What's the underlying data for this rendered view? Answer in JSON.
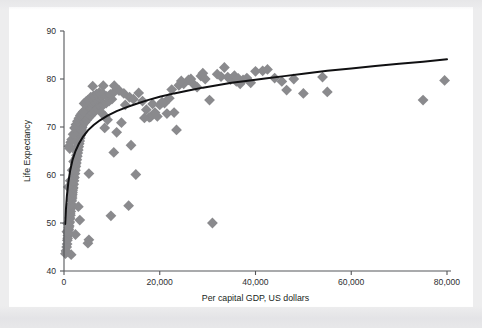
{
  "page": {
    "background_color": "#ededee",
    "sheet_color": "#ffffff"
  },
  "chart_data": {
    "type": "scatter",
    "title": "",
    "xlabel": "Per capital GDP, US dollars",
    "ylabel": "Life Expectancy",
    "xlim": [
      0,
      80000
    ],
    "ylim": [
      40,
      90
    ],
    "xticks": [
      0,
      20000,
      40000,
      60000,
      80000
    ],
    "xticklabels": [
      "0",
      "20,000",
      "40,000",
      "60,000",
      "80,000"
    ],
    "yticks": [
      40,
      50,
      60,
      70,
      80,
      90
    ],
    "yticklabels": [
      "40",
      "50",
      "60",
      "70",
      "80",
      "90"
    ],
    "grid": false,
    "legend": null,
    "marker": {
      "shape": "diamond",
      "color": "#8a8a8d",
      "size": 5.4
    },
    "series": [
      {
        "name": "Countries",
        "points": [
          [
            300,
            43.6
          ],
          [
            420,
            44.2
          ],
          [
            560,
            45.0
          ],
          [
            700,
            46.4
          ],
          [
            820,
            47.4
          ],
          [
            900,
            48.0
          ],
          [
            1000,
            48.6
          ],
          [
            1100,
            49.4
          ],
          [
            1200,
            50.2
          ],
          [
            1250,
            50.9
          ],
          [
            1350,
            51.6
          ],
          [
            1400,
            52.4
          ],
          [
            1500,
            53.1
          ],
          [
            1560,
            53.9
          ],
          [
            1600,
            54.6
          ],
          [
            1700,
            55.2
          ],
          [
            1750,
            56.0
          ],
          [
            1800,
            56.8
          ],
          [
            1900,
            57.4
          ],
          [
            1950,
            58.1
          ],
          [
            2000,
            58.8
          ],
          [
            2100,
            59.5
          ],
          [
            2150,
            60.2
          ],
          [
            2200,
            60.9
          ],
          [
            2300,
            61.5
          ],
          [
            2350,
            62.2
          ],
          [
            2400,
            62.9
          ],
          [
            2500,
            63.5
          ],
          [
            2600,
            64.1
          ],
          [
            2700,
            64.8
          ],
          [
            2800,
            65.4
          ],
          [
            2900,
            66.0
          ],
          [
            3000,
            66.5
          ],
          [
            3100,
            67.0
          ],
          [
            3200,
            67.6
          ],
          [
            3300,
            68.1
          ],
          [
            3400,
            68.6
          ],
          [
            3500,
            69.1
          ],
          [
            3600,
            69.6
          ],
          [
            3700,
            70.1
          ],
          [
            3800,
            70.5
          ],
          [
            3900,
            70.9
          ],
          [
            4000,
            71.3
          ],
          [
            4100,
            71.7
          ],
          [
            4200,
            72.0
          ],
          [
            4300,
            72.3
          ],
          [
            4400,
            72.6
          ],
          [
            4500,
            72.9
          ],
          [
            4600,
            73.2
          ],
          [
            4700,
            73.5
          ],
          [
            4800,
            73.8
          ],
          [
            5000,
            74.0
          ],
          [
            5200,
            74.3
          ],
          [
            5400,
            74.5
          ],
          [
            5600,
            74.8
          ],
          [
            5800,
            75.0
          ],
          [
            6000,
            75.2
          ],
          [
            6200,
            75.4
          ],
          [
            6400,
            75.6
          ],
          [
            6600,
            75.7
          ],
          [
            6800,
            75.9
          ],
          [
            7000,
            76.1
          ],
          [
            500,
            44.0
          ],
          [
            650,
            45.6
          ],
          [
            760,
            46.8
          ],
          [
            880,
            47.9
          ],
          [
            980,
            49.0
          ],
          [
            1080,
            50.0
          ],
          [
            1180,
            51.1
          ],
          [
            1280,
            52.0
          ],
          [
            1380,
            53.0
          ],
          [
            1480,
            53.8
          ],
          [
            1580,
            54.8
          ],
          [
            1680,
            55.6
          ],
          [
            1780,
            56.4
          ],
          [
            1880,
            57.2
          ],
          [
            1980,
            58.0
          ],
          [
            2080,
            58.8
          ],
          [
            2180,
            59.5
          ],
          [
            2280,
            60.3
          ],
          [
            2380,
            61.0
          ],
          [
            2480,
            61.8
          ],
          [
            2580,
            62.5
          ],
          [
            2680,
            63.2
          ],
          [
            2780,
            63.9
          ],
          [
            2880,
            64.6
          ],
          [
            2980,
            65.2
          ],
          [
            3080,
            65.9
          ],
          [
            3180,
            66.5
          ],
          [
            3280,
            67.1
          ],
          [
            3380,
            67.7
          ],
          [
            3480,
            68.3
          ],
          [
            3580,
            68.8
          ],
          [
            3680,
            69.4
          ],
          [
            3780,
            69.9
          ],
          [
            3880,
            70.4
          ],
          [
            4100,
            70.8
          ],
          [
            4300,
            71.3
          ],
          [
            4500,
            71.7
          ],
          [
            4700,
            72.1
          ],
          [
            4900,
            72.5
          ],
          [
            5100,
            72.8
          ],
          [
            5300,
            73.2
          ],
          [
            5500,
            73.5
          ],
          [
            5700,
            73.8
          ],
          [
            5900,
            74.1
          ],
          [
            6100,
            74.4
          ],
          [
            6300,
            74.7
          ],
          [
            6500,
            75.0
          ],
          [
            6700,
            75.2
          ],
          [
            6900,
            75.5
          ],
          [
            7200,
            75.8
          ],
          [
            7500,
            76.0
          ],
          [
            7800,
            76.3
          ],
          [
            1050,
            66.0
          ],
          [
            1200,
            65.5
          ],
          [
            1400,
            66.8
          ],
          [
            1600,
            67.4
          ],
          [
            1900,
            68.5
          ],
          [
            2200,
            69.8
          ],
          [
            2500,
            70.5
          ],
          [
            2800,
            71.2
          ],
          [
            3100,
            71.8
          ],
          [
            3400,
            72.4
          ],
          [
            3700,
            72.8
          ],
          [
            4000,
            73.2
          ],
          [
            4400,
            71.0
          ],
          [
            4800,
            71.5
          ],
          [
            5200,
            72.0
          ],
          [
            5600,
            72.4
          ],
          [
            6000,
            72.9
          ],
          [
            6500,
            73.3
          ],
          [
            7000,
            73.8
          ],
          [
            7600,
            74.2
          ],
          [
            8200,
            74.6
          ],
          [
            8800,
            75.0
          ],
          [
            9400,
            75.4
          ],
          [
            10000,
            75.8
          ],
          [
            4200,
            74.9
          ],
          [
            4600,
            75.3
          ],
          [
            5000,
            75.6
          ],
          [
            5600,
            76.2
          ],
          [
            6200,
            76.5
          ],
          [
            6800,
            76.9
          ],
          [
            7400,
            77.2
          ],
          [
            8100,
            77.0
          ],
          [
            8900,
            76.4
          ],
          [
            9700,
            76.8
          ],
          [
            10500,
            77.3
          ],
          [
            11500,
            77.6
          ],
          [
            6000,
            78.5
          ],
          [
            8200,
            78.6
          ],
          [
            10500,
            78.6
          ],
          [
            12500,
            77.0
          ],
          [
            13700,
            76.2
          ],
          [
            14500,
            75.8
          ],
          [
            15600,
            77.1
          ],
          [
            16400,
            75.4
          ],
          [
            17200,
            73.6
          ],
          [
            18100,
            72.1
          ],
          [
            19000,
            73.0
          ],
          [
            20000,
            74.6
          ],
          [
            21000,
            75.0
          ],
          [
            22000,
            76.0
          ],
          [
            23000,
            73.0
          ],
          [
            23500,
            69.4
          ],
          [
            24000,
            78.7
          ],
          [
            25000,
            79.0
          ],
          [
            26000,
            79.8
          ],
          [
            27000,
            79.0
          ],
          [
            27800,
            78.3
          ],
          [
            28600,
            80.6
          ],
          [
            29500,
            80.0
          ],
          [
            30400,
            75.6
          ],
          [
            31000,
            50.0
          ],
          [
            32000,
            81.0
          ],
          [
            32800,
            80.5
          ],
          [
            33500,
            82.4
          ],
          [
            34200,
            80.4
          ],
          [
            34800,
            79.9
          ],
          [
            35200,
            80.2
          ],
          [
            35600,
            80.7
          ],
          [
            36000,
            79.5
          ],
          [
            36400,
            80.1
          ],
          [
            36800,
            79.0
          ],
          [
            37400,
            79.8
          ],
          [
            38200,
            80.2
          ],
          [
            39000,
            79.2
          ],
          [
            40000,
            81.6
          ],
          [
            41500,
            81.7
          ],
          [
            42500,
            82.0
          ],
          [
            44000,
            80.2
          ],
          [
            45500,
            79.5
          ],
          [
            46500,
            77.7
          ],
          [
            48000,
            80.0
          ],
          [
            50000,
            77.0
          ],
          [
            54000,
            80.4
          ],
          [
            55000,
            77.3
          ],
          [
            75000,
            75.6
          ],
          [
            79500,
            79.7
          ],
          [
            5200,
            60.3
          ],
          [
            9800,
            51.5
          ],
          [
            10400,
            64.7
          ],
          [
            13500,
            53.6
          ],
          [
            14000,
            66.2
          ],
          [
            15000,
            60.1
          ],
          [
            11000,
            68.9
          ],
          [
            12000,
            70.9
          ],
          [
            3000,
            53.4
          ],
          [
            3300,
            50.6
          ],
          [
            2400,
            47.6
          ],
          [
            5000,
            45.8
          ],
          [
            5200,
            46.5
          ],
          [
            1500,
            43.4
          ],
          [
            8500,
            69.8
          ],
          [
            9100,
            71.5
          ],
          [
            17800,
            72.0
          ],
          [
            19500,
            72.2
          ],
          [
            20500,
            75.2
          ],
          [
            21500,
            72.8
          ],
          [
            22500,
            77.8
          ],
          [
            24500,
            79.6
          ],
          [
            26500,
            80.0
          ],
          [
            1700,
            61.0
          ],
          [
            2000,
            62.8
          ],
          [
            900,
            57.5
          ],
          [
            1300,
            58.8
          ],
          [
            600,
            48.2
          ],
          [
            750,
            49.9
          ],
          [
            7800,
            73.0
          ],
          [
            8600,
            72.2
          ],
          [
            12800,
            74.6
          ],
          [
            16800,
            71.9
          ],
          [
            18500,
            74.8
          ],
          [
            29000,
            81.2
          ]
        ]
      }
    ],
    "fit_curve": {
      "name": "logarithmic fit",
      "color": "#101012",
      "points": [
        [
          250,
          49.8
        ],
        [
          400,
          52.8
        ],
        [
          600,
          55.6
        ],
        [
          900,
          58.4
        ],
        [
          1300,
          61.0
        ],
        [
          1800,
          63.2
        ],
        [
          2400,
          65.0
        ],
        [
          3100,
          66.5
        ],
        [
          4000,
          68.0
        ],
        [
          5000,
          69.3
        ],
        [
          6200,
          70.4
        ],
        [
          7500,
          71.4
        ],
        [
          9000,
          72.3
        ],
        [
          11000,
          73.3
        ],
        [
          13000,
          74.1
        ],
        [
          15000,
          74.8
        ],
        [
          17500,
          75.6
        ],
        [
          20000,
          76.3
        ],
        [
          23000,
          77.0
        ],
        [
          26000,
          77.6
        ],
        [
          29000,
          78.2
        ],
        [
          32000,
          78.7
        ],
        [
          35000,
          79.2
        ],
        [
          38000,
          79.6
        ],
        [
          42000,
          80.1
        ],
        [
          46000,
          80.6
        ],
        [
          50000,
          81.1
        ],
        [
          55000,
          81.7
        ],
        [
          60000,
          82.2
        ],
        [
          65000,
          82.7
        ],
        [
          70000,
          83.2
        ],
        [
          75000,
          83.6
        ],
        [
          80000,
          84.1
        ]
      ]
    }
  }
}
